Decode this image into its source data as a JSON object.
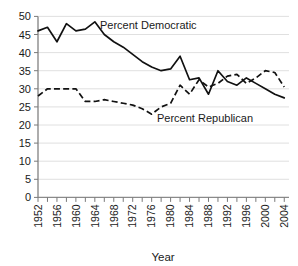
{
  "chart_data": {
    "type": "line",
    "title": "",
    "subtitle": "",
    "xlabel": "Year",
    "ylabel": "",
    "xlim": [
      1952,
      2005
    ],
    "ylim": [
      0,
      50
    ],
    "grid": true,
    "legend_position": "inline-annotation",
    "y_ticks": [
      0,
      5,
      10,
      15,
      20,
      25,
      30,
      35,
      40,
      45,
      50
    ],
    "y_tick_labels": [
      "0",
      "5",
      "10",
      "15",
      "20",
      "25",
      "30",
      "35",
      "40",
      "45",
      "50"
    ],
    "x_ticks_labeled": [
      1952,
      1956,
      1960,
      1964,
      1968,
      1972,
      1976,
      1980,
      1984,
      1988,
      1992,
      1996,
      2000,
      2004
    ],
    "x_tick_labels": [
      "1952",
      "1956",
      "1960",
      "1964",
      "1968",
      "1972",
      "1976",
      "1980",
      "1984",
      "1988",
      "1992",
      "1996",
      "2000",
      "2004"
    ],
    "x_minor_tick_interval": 2,
    "x": [
      1952,
      1954,
      1956,
      1958,
      1960,
      1962,
      1964,
      1966,
      1968,
      1970,
      1972,
      1974,
      1976,
      1978,
      1980,
      1982,
      1984,
      1986,
      1988,
      1990,
      1992,
      1994,
      1996,
      1998,
      2000,
      2002,
      2004
    ],
    "series": [
      {
        "name": "Percent Democratic",
        "style": "solid",
        "color": "#111111",
        "values": [
          46.0,
          47.0,
          43.0,
          48.0,
          46.0,
          46.5,
          48.5,
          45.0,
          43.0,
          41.5,
          39.5,
          37.5,
          36.0,
          35.0,
          35.5,
          39.0,
          32.5,
          33.0,
          28.5,
          35.0,
          32.0,
          31.0,
          33.0,
          31.5,
          30.0,
          28.5,
          27.5
        ],
        "annotation": {
          "text": "Percent Democratic",
          "x_px": 100,
          "y_px": 29
        }
      },
      {
        "name": "Percent Republican",
        "style": "dashed",
        "color": "#111111",
        "values": [
          28.0,
          30.0,
          30.0,
          30.0,
          30.0,
          26.5,
          26.5,
          27.0,
          26.5,
          26.0,
          25.5,
          24.5,
          23.0,
          25.0,
          26.0,
          31.0,
          28.5,
          32.5,
          30.5,
          31.5,
          33.5,
          34.0,
          31.5,
          33.0,
          35.0,
          34.5,
          30.5
        ],
        "annotation": {
          "text": "Percent Republican",
          "x_px": 157,
          "y_px": 122
        }
      }
    ]
  },
  "axes": {
    "x_axis_title": "Year",
    "y_axis_title": ""
  }
}
